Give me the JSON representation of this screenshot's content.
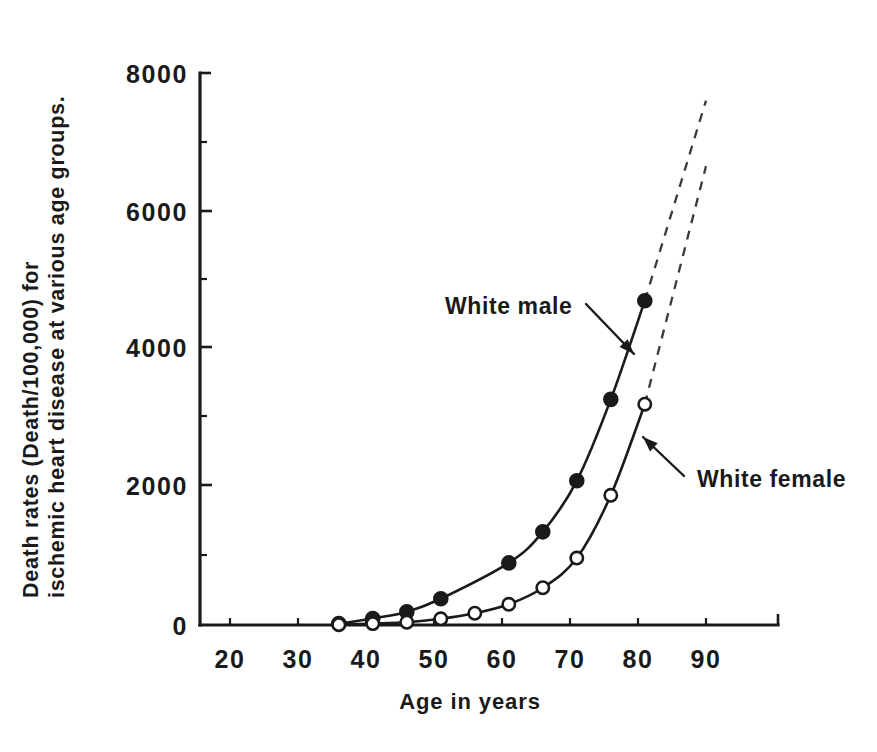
{
  "chart_data": {
    "type": "line",
    "title": "",
    "xlabel": "Age in years",
    "ylabel_line1": "Death rates (Death/100,000) for",
    "ylabel_line2": "ischemic heart disease at various age groups.",
    "xlim": [
      15,
      95
    ],
    "ylim": [
      0,
      8000
    ],
    "grid": false,
    "legend_position": "inline-annotations",
    "x_ticks": [
      20,
      30,
      40,
      50,
      60,
      70,
      80,
      90
    ],
    "x_tick_labels": [
      "20",
      "30",
      "40",
      "50",
      "60",
      "70",
      "80",
      "90"
    ],
    "y_ticks": [
      0,
      2000,
      4000,
      6000,
      8000
    ],
    "y_tick_labels": [
      "0",
      "2000",
      "4000",
      "6000",
      "8000"
    ],
    "series": [
      {
        "name": "White male",
        "marker": "filled-circle",
        "x": [
          36,
          41,
          46,
          51,
          61,
          66,
          71,
          76,
          81
        ],
        "values": [
          20,
          95,
          190,
          380,
          900,
          1350,
          2090,
          3270,
          4700
        ],
        "extrapolation": {
          "dashed": true,
          "x": [
            81,
            90
          ],
          "values": [
            4700,
            7600
          ]
        }
      },
      {
        "name": "White female",
        "marker": "open-circle",
        "x": [
          36,
          41,
          46,
          51,
          56,
          61,
          66,
          71,
          76,
          81
        ],
        "values": [
          5,
          20,
          40,
          90,
          170,
          300,
          540,
          970,
          1880,
          3200
        ],
        "extrapolation": {
          "dashed": true,
          "x": [
            81,
            90
          ],
          "values": [
            3200,
            6650
          ]
        }
      }
    ],
    "annotations": [
      {
        "label": "White male",
        "text_x": 445,
        "text_y": 314,
        "arrow_from_x": 586,
        "arrow_from_y": 304,
        "arrow_to_x": 634,
        "arrow_to_y": 354
      },
      {
        "label": "White female",
        "text_x": 697,
        "text_y": 487,
        "arrow_from_x": 684,
        "arrow_from_y": 476,
        "arrow_to_x": 643,
        "arrow_to_y": 437
      }
    ]
  }
}
